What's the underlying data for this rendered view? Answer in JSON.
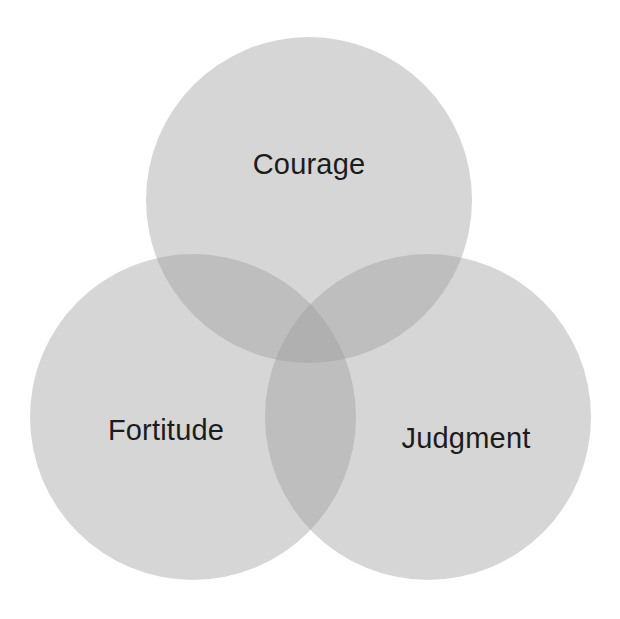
{
  "diagram": {
    "type": "venn",
    "sets": [
      {
        "id": "courage",
        "label": "Courage",
        "cx": 309,
        "cy": 200,
        "r": 163
      },
      {
        "id": "fortitude",
        "label": "Fortitude",
        "cx": 193,
        "cy": 417,
        "r": 163
      },
      {
        "id": "judgment",
        "label": "Judgment",
        "cx": 428,
        "cy": 417,
        "r": 163
      }
    ],
    "colors": {
      "circle_fill": "#9e9e9e",
      "single_region": "#d5d5d5",
      "overlap_region": "#bcbcbc",
      "triple_region": "#a9a9a9",
      "text": "#1c1c1c",
      "background": "#ffffff"
    }
  }
}
